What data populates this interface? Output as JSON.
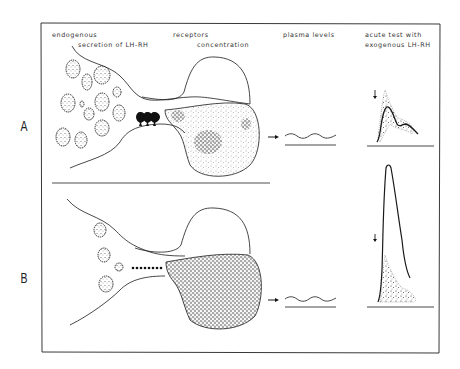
{
  "figure": {
    "columns": {
      "endogenous": "endogenous",
      "secretion": "secretion of LH-RH",
      "receptors": "receptors",
      "concentration": "concentration",
      "plasma": "plasma levels",
      "acute_line1": "acute test with",
      "acute_line2": "exogenous LH-RH"
    },
    "panels": [
      {
        "label": "A",
        "lhrh_secretion_marker": "three large black arrowheads",
        "lhrh_arrow_count": 3,
        "receptor_density": "sparse patches",
        "plasma_levels": "low, steady (wavy baseline)",
        "acute_response": "moderate peak within stippled normal range"
      },
      {
        "label": "B",
        "lhrh_secretion_marker": "row of small dots",
        "lhrh_dot_count": 8,
        "receptor_density": "dense, uniformly stippled",
        "plasma_levels": "low, steady (wavy baseline)",
        "acute_response": "very high peak exceeding stippled normal range"
      }
    ],
    "colors": {
      "ink": "#1a1a1a",
      "paper": "#ffffff"
    }
  }
}
